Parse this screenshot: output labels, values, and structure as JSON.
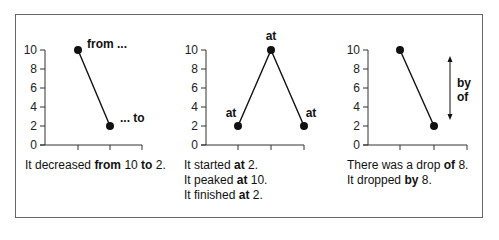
{
  "chart_data": [
    {
      "type": "line",
      "title": "",
      "xlabel": "",
      "ylabel": "",
      "ylim": [
        0,
        10
      ],
      "yticks": [
        0,
        2,
        4,
        6,
        8,
        10
      ],
      "x": [
        1,
        2
      ],
      "values": [
        10,
        2
      ],
      "annotations": [
        {
          "text": "from ...",
          "at_point": 0
        },
        {
          "text": "... to",
          "at_point": 1
        }
      ],
      "caption": [
        [
          {
            "t": "It decreased ",
            "b": false
          },
          {
            "t": "from",
            "b": true
          },
          {
            "t": " 10 ",
            "b": false
          },
          {
            "t": "to",
            "b": true
          },
          {
            "t": " 2.",
            "b": false
          }
        ]
      ]
    },
    {
      "type": "line",
      "title": "",
      "xlabel": "",
      "ylabel": "",
      "ylim": [
        0,
        10
      ],
      "yticks": [
        0,
        2,
        4,
        6,
        8,
        10
      ],
      "x": [
        1,
        2,
        3
      ],
      "values": [
        2,
        10,
        2
      ],
      "annotations": [
        {
          "text": "at",
          "at_point": 0
        },
        {
          "text": "at",
          "at_point": 1
        },
        {
          "text": "at",
          "at_point": 2
        }
      ],
      "caption": [
        [
          {
            "t": "It started ",
            "b": false
          },
          {
            "t": "at",
            "b": true
          },
          {
            "t": " 2.",
            "b": false
          }
        ],
        [
          {
            "t": "It peaked ",
            "b": false
          },
          {
            "t": "at",
            "b": true
          },
          {
            "t": " 10.",
            "b": false
          }
        ],
        [
          {
            "t": "It finished ",
            "b": false
          },
          {
            "t": "at",
            "b": true
          },
          {
            "t": " 2.",
            "b": false
          }
        ]
      ]
    },
    {
      "type": "line",
      "title": "",
      "xlabel": "",
      "ylabel": "",
      "ylim": [
        0,
        10
      ],
      "yticks": [
        0,
        2,
        4,
        6,
        8,
        10
      ],
      "x": [
        1,
        2
      ],
      "values": [
        10,
        2
      ],
      "annotations": [
        {
          "text": "by",
          "type": "double-arrow"
        },
        {
          "text": "of",
          "type": "double-arrow"
        }
      ],
      "caption": [
        [
          {
            "t": "There was a drop ",
            "b": false
          },
          {
            "t": "of",
            "b": true
          },
          {
            "t": " 8.",
            "b": false
          }
        ],
        [
          {
            "t": "It dropped ",
            "b": false
          },
          {
            "t": "by",
            "b": true
          },
          {
            "t": " 8.",
            "b": false
          }
        ]
      ]
    }
  ],
  "colors": {
    "line": "#111111",
    "axis": "#333333",
    "frame": "#666666"
  }
}
